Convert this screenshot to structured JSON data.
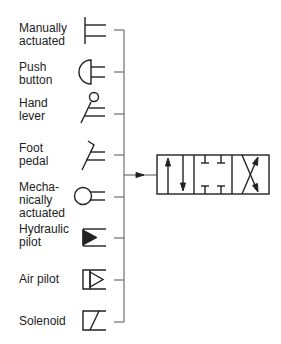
{
  "diagram": {
    "actuators": [
      {
        "id": "manual",
        "label": "Manually\nactuated",
        "icon": "manual-lever-icon"
      },
      {
        "id": "push",
        "label": "Push\nbutton",
        "icon": "push-button-icon"
      },
      {
        "id": "hand",
        "label": "Hand\nlever",
        "icon": "hand-lever-icon"
      },
      {
        "id": "foot",
        "label": "Foot\npedal",
        "icon": "foot-pedal-icon"
      },
      {
        "id": "mech",
        "label": "Mecha-\nnically\nactuated",
        "icon": "mechanical-roller-icon"
      },
      {
        "id": "hydraulic",
        "label": "Hydraulic\npilot",
        "icon": "hydraulic-pilot-icon"
      },
      {
        "id": "air",
        "label": "Air pilot",
        "icon": "air-pilot-icon"
      },
      {
        "id": "solenoid",
        "label": "Solenoid",
        "icon": "solenoid-icon"
      }
    ],
    "valve": {
      "name": "4-way 3-position valve",
      "positions": [
        "parallel-flow",
        "closed-center",
        "cross-flow"
      ]
    }
  }
}
